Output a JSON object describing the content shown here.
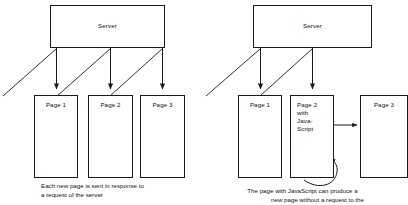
{
  "diagram": {
    "stroke_color": "#1a1a1a",
    "background_color": "#ffffff",
    "panels": [
      {
        "id": "classic-request-response",
        "server": {
          "label": "Server"
        },
        "pages": [
          {
            "id": "page-1",
            "label": "Page 1"
          },
          {
            "id": "page-2",
            "label": "Page 2"
          },
          {
            "id": "page-3",
            "label": "Page 3"
          }
        ],
        "caption_line_1": "Each new page is sent in response to",
        "caption_line_2": "a request of the server"
      },
      {
        "id": "javascript-request-response",
        "server": {
          "label": "Server"
        },
        "pages": [
          {
            "id": "page-1",
            "label": "Page 1"
          },
          {
            "id": "page-2-js",
            "label": "Page 2\nwith\nJava-\nScript"
          },
          {
            "id": "page-3",
            "label": "Page 3"
          }
        ],
        "caption_line_1": "The page with JavaScript can produce a",
        "caption_line_2": "new page without a request to the"
      }
    ]
  }
}
